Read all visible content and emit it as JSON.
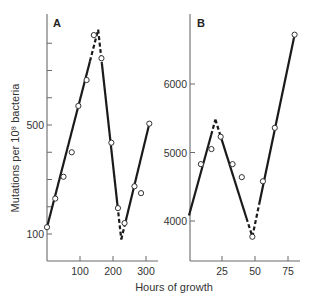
{
  "chart_data": [
    {
      "panel": "A",
      "type": "scatter",
      "title": "",
      "xlabel": "Hours of growth",
      "ylabel": "Mutations per 10⁸ bacteria",
      "xlim": [
        0,
        320
      ],
      "ylim": [
        70,
        900
      ],
      "xticks": [
        100,
        200,
        300
      ],
      "xtick_labels": [
        "100",
        "200",
        "300"
      ],
      "yticks": [
        100,
        200,
        300,
        400,
        500,
        600,
        700,
        800
      ],
      "ytick_labels": [
        "100",
        "",
        "",
        "",
        "500",
        "",
        "",
        ""
      ],
      "grid": false,
      "points": {
        "x": [
          0,
          25,
          50,
          75,
          95,
          120,
          142,
          165,
          195,
          215,
          235,
          265,
          285,
          310
        ],
        "y": [
          125,
          230,
          310,
          400,
          570,
          665,
          830,
          745,
          435,
          195,
          140,
          275,
          250,
          505
        ]
      },
      "fit_line": {
        "x": [
          0,
          155,
          225,
          310
        ],
        "y": [
          125,
          850,
          80,
          505
        ],
        "dashed_near_extrema": true
      }
    },
    {
      "panel": "B",
      "type": "scatter",
      "title": "",
      "xlabel": "Hours of growth",
      "ylabel": "",
      "xlim": [
        0,
        88
      ],
      "ylim": [
        3400,
        7000
      ],
      "xticks": [
        25,
        50,
        75
      ],
      "xtick_labels": [
        "25",
        "50",
        "75"
      ],
      "yticks": [
        4000,
        5000,
        6000
      ],
      "ytick_labels": [
        "4000",
        "5000",
        "6000"
      ],
      "grid": false,
      "points": {
        "x": [
          9,
          17,
          24,
          33,
          40,
          48,
          56,
          65,
          80
        ],
        "y": [
          4830,
          5050,
          5230,
          4830,
          4640,
          3770,
          4580,
          5360,
          6720
        ]
      },
      "fit_line": {
        "x": [
          0,
          20,
          48,
          80
        ],
        "y": [
          4080,
          5480,
          3770,
          6720
        ],
        "dashed_near_extrema": true
      }
    }
  ],
  "labels": {
    "panel_a": "A",
    "panel_b": "B",
    "y_axis_title": "Mutations per 10⁸ bacteria",
    "x_axis_title": "Hours of growth"
  }
}
